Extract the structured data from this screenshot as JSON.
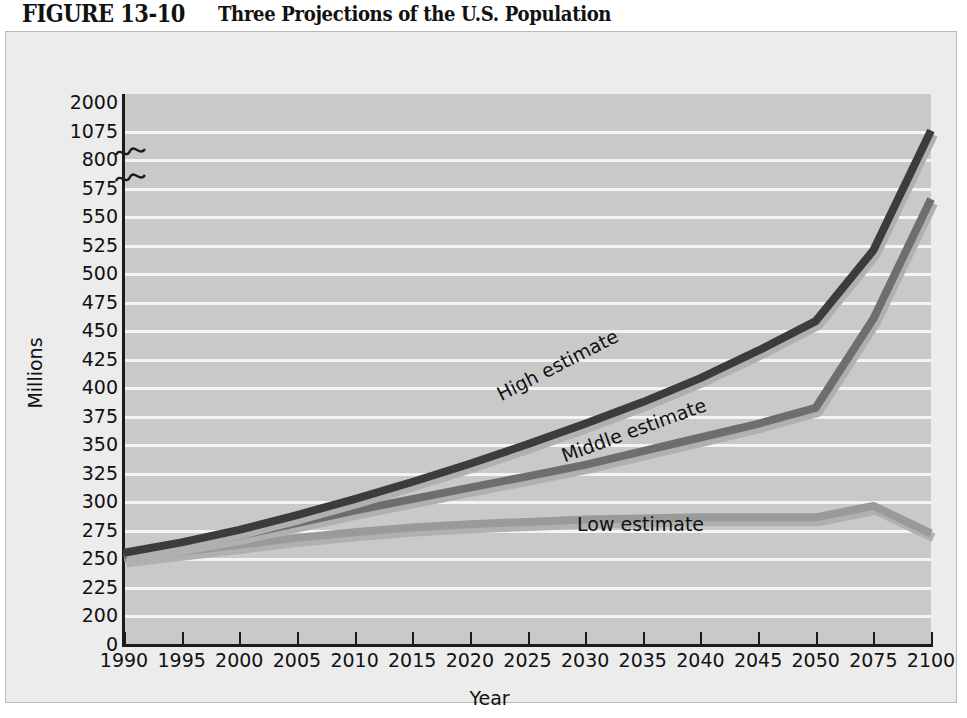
{
  "figure": {
    "number": "FIGURE 13-10",
    "caption": "Three Projections of the U.S. Population"
  },
  "chart_data": {
    "type": "line",
    "title": "Three Projections of the U.S. Population",
    "xlabel": "Year",
    "ylabel": "Millions",
    "categories": [
      "1990",
      "1995",
      "2000",
      "2005",
      "2010",
      "2015",
      "2020",
      "2025",
      "2030",
      "2035",
      "2040",
      "2045",
      "2050",
      "2075",
      "2100"
    ],
    "ytick_labels": [
      "2000",
      "1075",
      "800",
      "575",
      "550",
      "525",
      "500",
      "475",
      "450",
      "425",
      "400",
      "375",
      "350",
      "325",
      "300",
      "275",
      "250",
      "225",
      "200",
      "0"
    ],
    "ylim": [
      0,
      2000
    ],
    "axis_break": true,
    "axis_break_note": "Scale broken between 575 and 800 and between 800 and 1075",
    "grid": "horizontal",
    "legend": "inline-labels",
    "series": [
      {
        "name": "High estimate",
        "color": "#3c3c3c",
        "values": [
          255,
          264,
          275,
          288,
          302,
          317,
          333,
          350,
          368,
          387,
          408,
          432,
          458,
          520,
          1080
        ]
      },
      {
        "name": "Middle estimate",
        "color": "#6e6e6e",
        "values": [
          253,
          261,
          270,
          281,
          292,
          302,
          312,
          322,
          332,
          344,
          356,
          368,
          382,
          460,
          565
        ]
      },
      {
        "name": "Low estimate",
        "color": "#9a9a9a",
        "values": [
          250,
          256,
          262,
          268,
          273,
          277,
          280,
          282,
          284,
          285,
          286,
          286,
          286,
          296,
          272
        ]
      }
    ]
  },
  "colors": {
    "plot_background": "#c9c9ca",
    "figure_background": "#ececed",
    "gridline": "#f4f4f4",
    "axis": "#1b1b1b",
    "high": "#3c3c3c",
    "middle": "#6e6e6e",
    "low": "#9a9a9a"
  }
}
